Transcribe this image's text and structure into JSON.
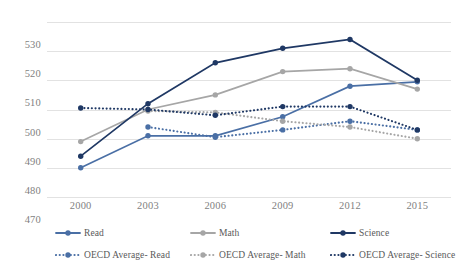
{
  "chart_data": {
    "type": "line",
    "title": "",
    "xlabel": "",
    "ylabel": "",
    "categories": [
      "2000",
      "2003",
      "2006",
      "2009",
      "2012",
      "2015"
    ],
    "ylim": [
      470,
      530
    ],
    "yticks": [
      470,
      480,
      490,
      500,
      510,
      520,
      530
    ],
    "grid": true,
    "legend_position": "bottom",
    "series": [
      {
        "name": "Read",
        "color": "#4A6FA5",
        "style": "solid",
        "values": [
          480,
          491,
          491,
          497.5,
          508,
          509.5
        ]
      },
      {
        "name": "Math",
        "color": "#A6A6A6",
        "style": "solid",
        "values": [
          489,
          500,
          505,
          513,
          514,
          507
        ]
      },
      {
        "name": "Science",
        "color": "#1F3864",
        "style": "solid",
        "values": [
          484,
          502,
          516,
          521,
          524,
          510
        ]
      },
      {
        "name": "OECD Average- Read",
        "color": "#4A6FA5",
        "style": "dotted",
        "values": [
          null,
          494,
          490.5,
          493,
          496,
          493
        ]
      },
      {
        "name": "OECD Average- Math",
        "color": "#A6A6A6",
        "style": "dotted",
        "values": [
          null,
          499.5,
          499,
          496,
          494,
          490
        ]
      },
      {
        "name": "OECD Average- Science",
        "color": "#1F3864",
        "style": "dotted",
        "values": [
          500.5,
          500,
          498,
          501,
          501,
          493
        ]
      }
    ]
  },
  "legend": {
    "rows": [
      [
        {
          "label": "Read",
          "color": "#4A6FA5",
          "style": "solid"
        },
        {
          "label": "Math",
          "color": "#A6A6A6",
          "style": "solid"
        },
        {
          "label": "Science",
          "color": "#1F3864",
          "style": "solid"
        }
      ],
      [
        {
          "label": "OECD Average- Read",
          "color": "#4A6FA5",
          "style": "dotted"
        },
        {
          "label": "OECD Average- Math",
          "color": "#A6A6A6",
          "style": "dotted"
        },
        {
          "label": "OECD Average- Science",
          "color": "#1F3864",
          "style": "dotted"
        }
      ]
    ]
  }
}
